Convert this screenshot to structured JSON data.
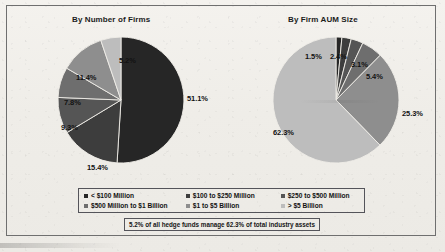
{
  "figure": {
    "background_color": "#f1efea",
    "border_color": "#6f6f6f"
  },
  "legend": {
    "items": [
      {
        "label": "< $100 Million",
        "color": "#262626"
      },
      {
        "label": "$100 to $250 Million",
        "color": "#3d3d3d"
      },
      {
        "label": "$250 to $500 Million",
        "color": "#555555"
      },
      {
        "label": "$500 Million to $1 Billion",
        "color": "#6e6e6e"
      },
      {
        "label": "$1 to $5 Billion",
        "color": "#8e8e8e"
      },
      {
        "label": "> $5 Billion",
        "color": "#bdbdbd"
      }
    ]
  },
  "footnote": {
    "text": "5.2% of all hedge funds manage 62.3% of total industry assets"
  },
  "chart_data": [
    {
      "type": "pie",
      "title": "By Number of Firms",
      "categories": [
        "< $100 Million",
        "$100 to $250 Million",
        "$250 to $500 Million",
        "$500 Million to $1 Billion",
        "$1 to $5 Billion",
        "> $5 Billion"
      ],
      "values": [
        51.1,
        15.4,
        9.3,
        7.8,
        11.4,
        5.2
      ],
      "value_labels": [
        "51.1%",
        "15.4%",
        "9.3%",
        "7.8%",
        "11.4%",
        "5.2%"
      ],
      "colors": [
        "#262626",
        "#3d3d3d",
        "#555555",
        "#6e6e6e",
        "#8e8e8e",
        "#bdbdbd"
      ],
      "units": "percent",
      "legend_position": "bottom-shared",
      "start_angle_deg": 0,
      "direction": "clockwise"
    },
    {
      "type": "pie",
      "title": "By Firm AUM Size",
      "categories": [
        "< $100 Million",
        "$100 to $250 Million",
        "$250 to $500 Million",
        "$500 Million to $1 Billion",
        "$1 to $5 Billion",
        "> $5 Billion"
      ],
      "values": [
        1.5,
        2.4,
        3.1,
        5.4,
        25.3,
        62.3
      ],
      "value_labels": [
        "1.5%",
        "2.4%",
        "3.1%",
        "5.4%",
        "25.3%",
        "62.3%"
      ],
      "colors": [
        "#262626",
        "#3d3d3d",
        "#555555",
        "#6e6e6e",
        "#8e8e8e",
        "#bdbdbd"
      ],
      "units": "percent",
      "legend_position": "bottom-shared",
      "start_angle_deg": 0,
      "direction": "clockwise"
    }
  ],
  "labels_left": [
    {
      "text": "51.1%",
      "x": 131,
      "y": 59
    },
    {
      "text": "15.4%",
      "x": 31,
      "y": 128
    },
    {
      "text": "9.3%",
      "x": 5,
      "y": 88
    },
    {
      "text": "7.8%",
      "x": 8,
      "y": 63
    },
    {
      "text": "11.4%",
      "x": 20,
      "y": 38
    },
    {
      "text": "5.2%",
      "x": 63,
      "y": 21
    }
  ],
  "labels_right": [
    {
      "text": "1.5%",
      "x": 34,
      "y": 17
    },
    {
      "text": "2.4%",
      "x": 59,
      "y": 17
    },
    {
      "text": "3.1%",
      "x": 80,
      "y": 25
    },
    {
      "text": "5.4%",
      "x": 95,
      "y": 37
    },
    {
      "text": "25.3%",
      "x": 131,
      "y": 74
    },
    {
      "text": "62.3%",
      "x": 2,
      "y": 93
    }
  ]
}
